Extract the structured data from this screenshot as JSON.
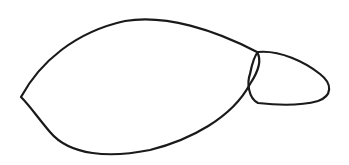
{
  "drawing": {
    "subject": "hand-drawn outline of two joined shapes",
    "background_color": "#ffffff",
    "stroke_color": "#1a1a1a",
    "shapes": [
      {
        "name": "large-body",
        "description": "large leaf/seed-shaped outline with a pointed left tip"
      },
      {
        "name": "small-lobe",
        "description": "small rounded lobe attached at the right end, overlapping the large shape"
      }
    ]
  }
}
